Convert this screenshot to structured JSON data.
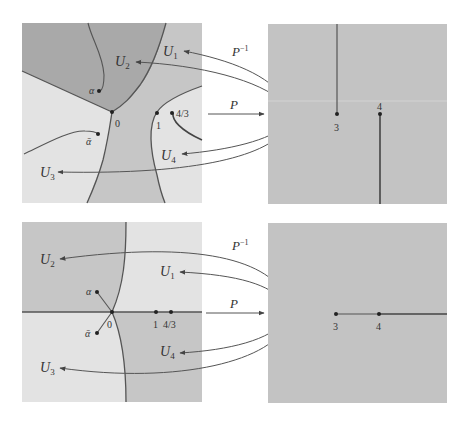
{
  "colors": {
    "background": "#ffffff",
    "region_dark": "#a9a9a9",
    "region_mid": "#c6c6c6",
    "region_light": "#e3e3e3",
    "right_panel": "#c3c3c3",
    "curve": "#555555",
    "arrow": "#555555",
    "text": "#333333"
  },
  "top": {
    "left_panel": {
      "region_labels": [
        "U1",
        "U2",
        "U3",
        "U4"
      ],
      "points": [
        {
          "name": "alpha",
          "label": "α"
        },
        {
          "name": "alpha-bar",
          "label": "ᾱ"
        },
        {
          "name": "zero",
          "label": "0"
        },
        {
          "name": "one",
          "label": "1"
        },
        {
          "name": "four-thirds",
          "label": "4/3"
        }
      ]
    },
    "map_forward": "P",
    "map_inverse": "P",
    "map_inverse_sup": "−1",
    "center_label": "V",
    "right_panel": {
      "points": [
        {
          "name": "three",
          "label": "3"
        },
        {
          "name": "four",
          "label": "4"
        }
      ],
      "cuts": "vertical"
    }
  },
  "bottom": {
    "left_panel": {
      "region_labels": [
        "U1",
        "U2",
        "U3",
        "U4"
      ],
      "points": [
        {
          "name": "alpha",
          "label": "α"
        },
        {
          "name": "alpha-bar",
          "label": "ᾱ"
        },
        {
          "name": "zero",
          "label": "0"
        },
        {
          "name": "one",
          "label": "1"
        },
        {
          "name": "four-thirds",
          "label": "4/3"
        }
      ]
    },
    "map_forward": "P",
    "map_inverse": "P",
    "map_inverse_sup": "−1",
    "center_label": "V",
    "right_panel": {
      "points": [
        {
          "name": "three",
          "label": "3"
        },
        {
          "name": "four",
          "label": "4"
        }
      ],
      "cuts": "horizontal"
    }
  },
  "labels": {
    "U": "U",
    "sub1": "1",
    "sub2": "2",
    "sub3": "3",
    "sub4": "4"
  }
}
